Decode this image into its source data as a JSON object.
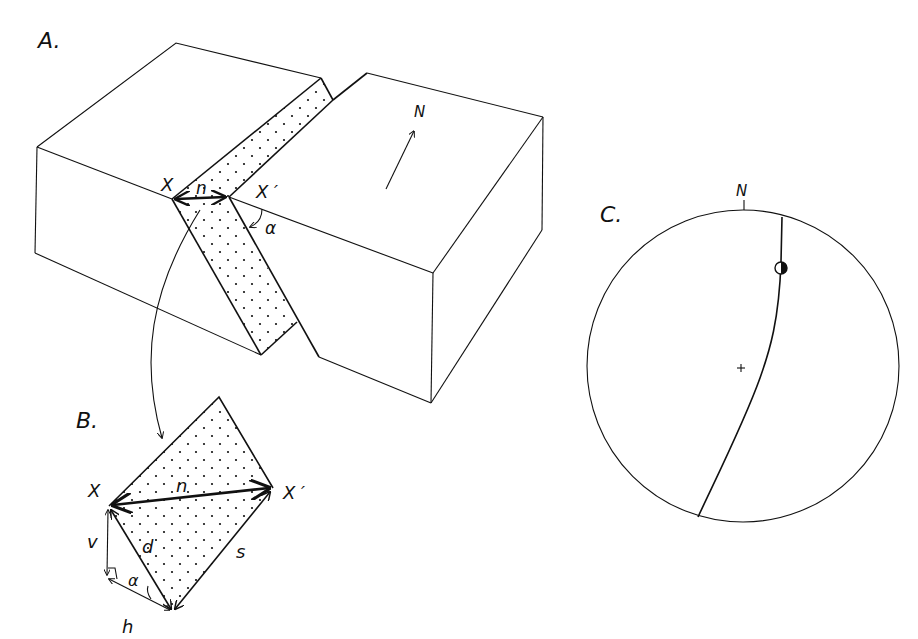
{
  "panels": {
    "A": {
      "label": "A.",
      "north_label": "N",
      "point_x": "X",
      "point_x_prime": "X ′",
      "separation_label": "n",
      "angle_label": "α"
    },
    "B": {
      "label": "B.",
      "point_x": "X",
      "point_x_prime": "X ′",
      "net_slip_label": "n",
      "dip_slip_label": "d",
      "strike_slip_label": "s",
      "vertical_label": "v",
      "horizontal_label": "h",
      "angle_label": "α"
    },
    "C": {
      "label": "C.",
      "north_label": "N",
      "center_mark": "+"
    }
  },
  "colors": {
    "ink": "#111111",
    "background": "#ffffff"
  }
}
